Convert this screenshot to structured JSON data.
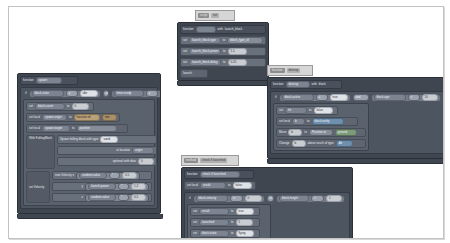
{
  "app": {
    "type": "blockly-visual-code-editor",
    "canvas_background": "#ffffff",
    "canvas_border": "#c3c3c3",
    "block_palette": {
      "function_wrapper": "#3f4650",
      "control_wrapper": "#4d5560",
      "statement_row": "#68707c",
      "value_pill": "#858d99",
      "number_field": "#c9ccd1",
      "text_field": "#dfe2e6",
      "accent_block": "#b9a07a"
    }
  },
  "clusters": {
    "launch_block": {
      "tab": {
        "chip1": "script",
        "chip2": "init"
      },
      "header": {
        "kw_function": "function",
        "name": "",
        "kw_with": "with",
        "param": "launch_block"
      },
      "rows": [
        {
          "kw_set": "set",
          "var": "launch_block.type",
          "kw_to": "to",
          "value": "block_type_id"
        },
        {
          "kw_set": "set",
          "var": "launch_block.power",
          "kw_to": "to",
          "value": "1.5"
        },
        {
          "kw_set": "set",
          "var": "launch_block.delay",
          "kw_to": "to",
          "value": "0.25"
        }
      ],
      "call": "launch"
    },
    "spawn_falling": {
      "tab": {
        "chip1": "function",
        "chip2": "spawn"
      },
      "header": {
        "kw_function": "function",
        "name": "spawn"
      },
      "if_header": {
        "kw_if": "if"
      },
      "condition": {
        "left": {
          "var": "block.state",
          "op": "=",
          "value": "idle"
        },
        "join": "and",
        "right": {
          "var": "timer.ready",
          "op": "=",
          "value": "true"
        }
      },
      "rows": [
        {
          "kw_set": "set",
          "var": "block.count",
          "kw_to": "to",
          "value": "0"
        },
        {
          "kw_set": "set local",
          "var": "spawn.origin",
          "kw_to": "to",
          "fn": "function of",
          "arg": "me"
        },
        {
          "kw_set": "set local",
          "var": "spawn.target",
          "kw_to": "to",
          "value": "position"
        }
      ],
      "with_falling": {
        "label": "With FallingBlock",
        "statement": "Spawn falling block with type",
        "type_value": "sand",
        "at_location": "at location",
        "location_value": "origin",
        "optional": "optional with data",
        "data_value": "0"
      },
      "set_velocity": {
        "label": "set Velocity",
        "statement": "new Velocity x",
        "axes": [
          {
            "axis": "x",
            "expr_left": "random.value",
            "op": "*",
            "expr_right": "0.5"
          },
          {
            "axis": "y",
            "expr_left": "launch.power",
            "op": "*",
            "expr_right": "1.2"
          },
          {
            "axis": "z",
            "expr_left": "random.value",
            "op": "*",
            "expr_right": "0.5"
          }
        ]
      }
    },
    "destroy": {
      "tab": {
        "chip1": "function",
        "chip2": "destroy"
      },
      "header": {
        "kw_function": "function",
        "name": "destroy",
        "kw_with": "with",
        "param": "block"
      },
      "if_header": {
        "kw_if": "if"
      },
      "condition": {
        "left": {
          "var": "block.active",
          "op": "=",
          "value": "true"
        },
        "join": "and",
        "right": {
          "var": "block.age",
          "op": ">",
          "value": "10"
        }
      },
      "rows": [
        {
          "kw_set": "set",
          "var": "hit",
          "kw_to": "to",
          "value": "false"
        },
        {
          "kw_set": "set local",
          "var": "b",
          "kw_to": "to",
          "value": "block.entity"
        },
        {
          "kw_move": "Move",
          "target": "b",
          "kw_to": "to",
          "fn": "Position at",
          "value": "ground"
        },
        {
          "kw_change": "Change",
          "target": "b",
          "label": "above touch of type",
          "value": "Air"
        }
      ]
    },
    "check_launched": {
      "tab": {
        "chip1": "method",
        "chip2": "check if launched"
      },
      "header": {
        "kw_function": "function",
        "name": "check if launched"
      },
      "first_row": {
        "kw_set": "set local",
        "var": "result",
        "kw_to": "to",
        "value": "false"
      },
      "if_header": {
        "kw_if": "if"
      },
      "condition": {
        "left": {
          "var": "block.velocity",
          "op": "!=",
          "value": "0"
        },
        "join": "or",
        "right": {
          "var": "block.height",
          "op": ">",
          "value": "1"
        }
      },
      "rows": [
        {
          "kw_set": "set",
          "var": "result",
          "kw_to": "to",
          "value": "true"
        },
        {
          "kw_set": "set",
          "var": "launched",
          "kw_to": "to",
          "value": "1"
        },
        {
          "kw_set": "set",
          "var": "block.state",
          "kw_to": "to",
          "value": "flying"
        }
      ],
      "return": {
        "kw_return": "return",
        "value": "result"
      }
    }
  }
}
